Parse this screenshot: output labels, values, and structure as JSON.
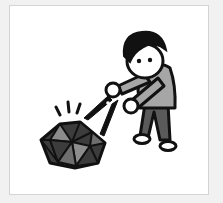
{
  "illustration": {
    "subject": "person cutting a rock with scissors",
    "elements": [
      "person",
      "scissors",
      "rock",
      "impact-lines"
    ],
    "colors": {
      "background": "#f1f1f1",
      "panel": "#ffffff",
      "panel_border": "#d4d4d4",
      "outline": "#111111",
      "hair": "#111111",
      "skin": "#ffffff",
      "shirt": "#a6a6a6",
      "pants": "#5a5a5a",
      "shoes": "#ffffff",
      "rock_dark": "#3c3c3c",
      "rock_mid": "#6e6e6e",
      "rock_light": "#8c8c8c"
    }
  }
}
